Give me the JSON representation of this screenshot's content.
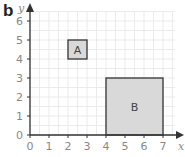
{
  "figure_label": "b",
  "axes": {
    "x_label": "x",
    "y_label": "y",
    "x_ticks": [
      "0",
      "1",
      "2",
      "3",
      "4",
      "5",
      "6",
      "7"
    ],
    "y_ticks": [
      "0",
      "1",
      "2",
      "3",
      "4",
      "5",
      "6"
    ]
  },
  "shapes": [
    {
      "name": "A",
      "x1": 2,
      "y1": 4,
      "x2": 3,
      "y2": 5
    },
    {
      "name": "B",
      "x1": 4,
      "y1": 0,
      "x2": 7,
      "y2": 3
    }
  ],
  "colors": {
    "grid": "#e6e6e6",
    "axis": "#333333",
    "tick_label": "#888888",
    "shape_fill": "#d9d9d9",
    "shape_stroke": "#333333"
  }
}
